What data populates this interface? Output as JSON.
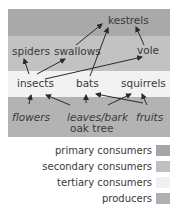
{
  "diagram": {
    "bands": [
      {
        "name": "band-top",
        "color": "#a9a9a9"
      },
      {
        "name": "band-second",
        "color": "#c2c2c2"
      },
      {
        "name": "band-third",
        "color": "#f2f2f2"
      },
      {
        "name": "band-bottom",
        "color": "#b3b3b3"
      }
    ],
    "nodes": {
      "kestrels": "kestrels",
      "spiders": "spiders",
      "swallows": "swallows",
      "vole": "vole",
      "insects": "insects",
      "bats": "bats",
      "squirrels": "squirrels",
      "flowers": "flowers",
      "leaves_bark": "leaves/bark",
      "oak_tree": "oak tree",
      "fruits": "fruits"
    },
    "edges": [
      [
        "flowers",
        "insects"
      ],
      [
        "leaves_bark",
        "insects"
      ],
      [
        "leaves_bark",
        "bats"
      ],
      [
        "leaves_bark",
        "squirrels"
      ],
      [
        "fruits",
        "bats"
      ],
      [
        "fruits",
        "squirrels"
      ],
      [
        "insects",
        "spiders"
      ],
      [
        "insects",
        "swallows"
      ],
      [
        "insects",
        "vole"
      ],
      [
        "bats",
        "kestrels"
      ],
      [
        "swallows",
        "kestrels"
      ],
      [
        "vole",
        "kestrels"
      ]
    ]
  },
  "legend": [
    {
      "label": "primary consumers",
      "color": "#a6a6a6"
    },
    {
      "label": "secondary consumers",
      "color": "#bfbfbf"
    },
    {
      "label": "tertiary consumers",
      "color": "#f0f0f0"
    },
    {
      "label": "producers",
      "color": "#b0b0b0"
    }
  ]
}
